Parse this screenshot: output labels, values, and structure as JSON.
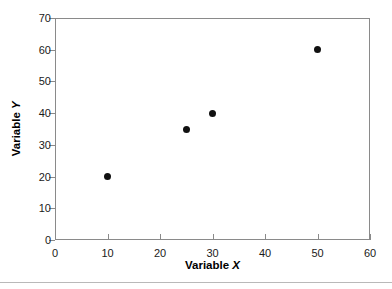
{
  "chart_data": {
    "type": "scatter",
    "title": "",
    "xlabel_prefix": "Variable",
    "xlabel_symbol": "X",
    "ylabel_prefix": "Variable",
    "ylabel_symbol": "Y",
    "xlim": [
      0,
      60
    ],
    "ylim": [
      0,
      70
    ],
    "xticks": [
      0,
      10,
      20,
      30,
      40,
      50,
      60
    ],
    "yticks": [
      0,
      10,
      20,
      30,
      40,
      50,
      60,
      70
    ],
    "xtick_labels": [
      "0",
      "10",
      "20",
      "30",
      "40",
      "50",
      "60"
    ],
    "ytick_labels": [
      "0",
      "10",
      "20",
      "30",
      "40",
      "50",
      "60",
      "70"
    ],
    "grid": false,
    "legend": false,
    "x": [
      10,
      25,
      30,
      50
    ],
    "y": [
      20,
      35,
      40,
      60
    ],
    "points": [
      {
        "x": 10,
        "y": 20
      },
      {
        "x": 25,
        "y": 35
      },
      {
        "x": 30,
        "y": 40
      },
      {
        "x": 50,
        "y": 60
      }
    ],
    "marker": "filled-circle",
    "marker_color": "#111111",
    "axis_color": "#8a8a8a",
    "background_color": "#ffffff"
  }
}
